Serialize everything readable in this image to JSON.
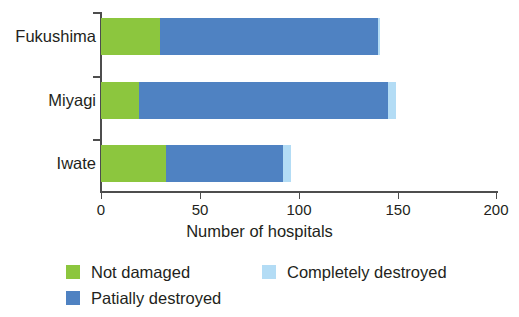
{
  "chart_data": {
    "type": "bar",
    "orientation": "horizontal",
    "stacked": true,
    "title": "",
    "xlabel": "Number of hospitals",
    "ylabel": "",
    "xlim": [
      0,
      200
    ],
    "xticks": [
      0,
      50,
      100,
      150,
      200
    ],
    "xtick_labels": [
      "0",
      "50",
      "100",
      "150",
      "200"
    ],
    "grid": false,
    "legend_position": "bottom-left",
    "categories": [
      "Fukushima",
      "Miyagi",
      "Iwate"
    ],
    "series": [
      {
        "name": "Not damaged",
        "color": "#8cc63e",
        "values": [
          30,
          19,
          33
        ]
      },
      {
        "name": "Patially destroyed",
        "color": "#4f82c2",
        "values": [
          110,
          126,
          59
        ]
      },
      {
        "name": "Completely destroyed",
        "color": "#b3dcf5",
        "values": [
          1,
          4,
          4
        ]
      }
    ],
    "totals": [
      141,
      149,
      96
    ]
  },
  "legend": {
    "items": [
      {
        "label": "Not damaged",
        "color": "#8cc63e"
      },
      {
        "label": "Patially destroyed",
        "color": "#4f82c2"
      },
      {
        "label": "Completely destroyed",
        "color": "#b3dcf5"
      }
    ]
  },
  "axis": {
    "x_title": "Number of hospitals"
  }
}
